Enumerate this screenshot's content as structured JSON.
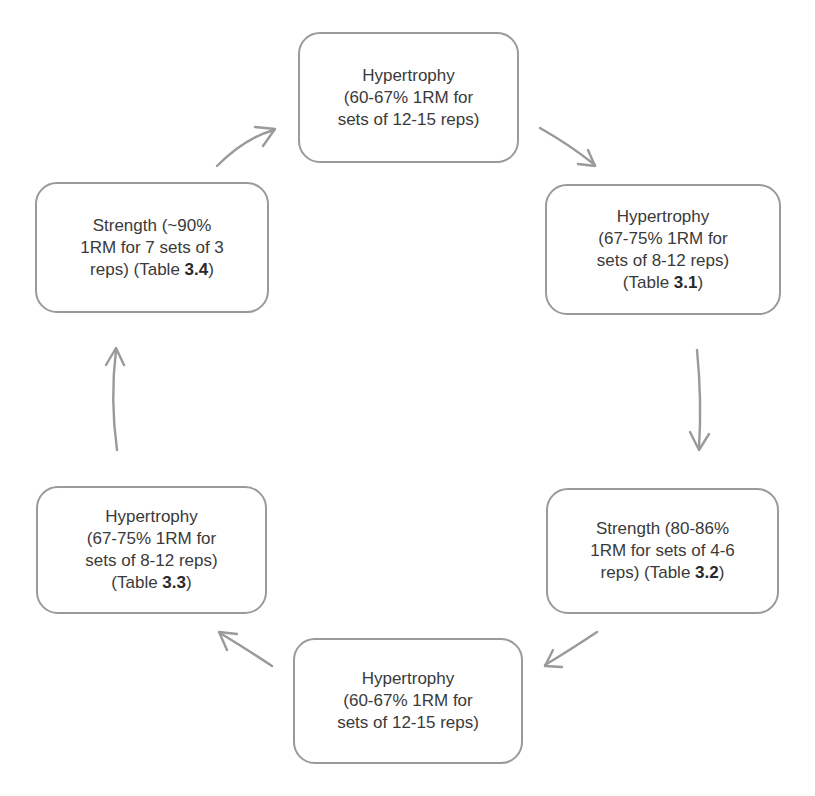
{
  "diagram": {
    "type": "cycle",
    "colors": {
      "border": "#9a9a9a",
      "arrow": "#9a9a9a",
      "text": "#3a3a3a",
      "background": "#ffffff"
    },
    "nodes": [
      {
        "id": "top",
        "lines": [
          "Hypertrophy",
          "(60-67% 1RM for",
          "sets of 12-15 reps)"
        ],
        "table_prefix": "",
        "table_ref": ""
      },
      {
        "id": "right",
        "lines": [
          "Hypertrophy",
          "(67-75% 1RM for",
          "sets of 8-12 reps)"
        ],
        "table_prefix": "(Table ",
        "table_ref": "3.1",
        "table_suffix": ")"
      },
      {
        "id": "bottom-right",
        "lines": [
          "Strength (80-86%",
          "1RM for sets of 4-6"
        ],
        "last_line_prefix": "reps) (Table ",
        "table_ref": "3.2",
        "table_suffix": ")"
      },
      {
        "id": "bottom",
        "lines": [
          "Hypertrophy",
          "(60-67% 1RM for",
          "sets of 12-15 reps)"
        ],
        "table_prefix": "",
        "table_ref": ""
      },
      {
        "id": "bottom-left",
        "lines": [
          "Hypertrophy",
          "(67-75% 1RM for",
          "sets of 8-12 reps)"
        ],
        "table_prefix": "(Table ",
        "table_ref": "3.3",
        "table_suffix": ")"
      },
      {
        "id": "left",
        "lines": [
          "Strength (~90%",
          "1RM for 7 sets of 3"
        ],
        "last_line_prefix": "reps) (Table ",
        "table_ref": "3.4",
        "table_suffix": ")"
      }
    ],
    "edges": [
      {
        "from": "top",
        "to": "right"
      },
      {
        "from": "right",
        "to": "bottom-right"
      },
      {
        "from": "bottom-right",
        "to": "bottom"
      },
      {
        "from": "bottom",
        "to": "bottom-left"
      },
      {
        "from": "bottom-left",
        "to": "left"
      },
      {
        "from": "left",
        "to": "top"
      }
    ]
  }
}
